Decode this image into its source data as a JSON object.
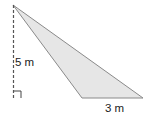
{
  "diagram": {
    "type": "obtuse-triangle-with-height",
    "labels": {
      "height": "5 m",
      "base": "3 m"
    },
    "colors": {
      "fill": "#e6e6e6",
      "stroke": "#8a8a8a",
      "dashed": "#555555",
      "text": "#222222"
    }
  }
}
